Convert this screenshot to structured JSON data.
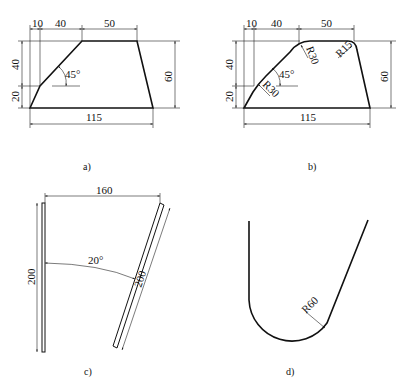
{
  "figures": [
    {
      "id": "a",
      "caption": "a)",
      "dims": {
        "top_left": "10",
        "top_mid": "40",
        "top_right": "50",
        "left_upper": "40",
        "left_lower": "20",
        "right": "60",
        "bottom": "115",
        "angle": "45°"
      }
    },
    {
      "id": "b",
      "caption": "b)",
      "dims": {
        "top_left": "10",
        "top_mid": "40",
        "top_right": "50",
        "left_upper": "40",
        "left_lower": "20",
        "right": "60",
        "bottom": "115",
        "angle": "45°",
        "radius_top_left": "R30",
        "radius_lower_left": "R30",
        "radius_top_right": "R15"
      }
    },
    {
      "id": "c",
      "caption": "c)",
      "dims": {
        "horizontal": "160",
        "vertical_left": "200",
        "slanted": "200",
        "angle": "20°"
      }
    },
    {
      "id": "d",
      "caption": "d)",
      "dims": {
        "radius": "R60"
      }
    }
  ]
}
